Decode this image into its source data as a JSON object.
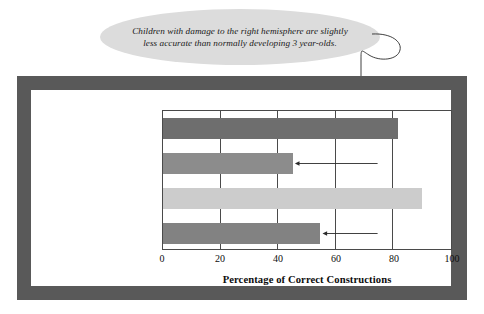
{
  "callout": {
    "text": "Children with damage to the right hemisphere are slightly less accurate than normally developing 3 year-olds."
  },
  "colors": {
    "frame": "#595959",
    "panel": "#ffffff",
    "callout_fill": "#dcdcdc",
    "axis": "#4a4a4a",
    "bar_left_hemisphere": "#6e6e6e",
    "bar_right_hemisphere": "#8c8c8c",
    "bar_4_year_olds": "#cccccc",
    "bar_3_year_olds": "#828282",
    "text": "#0d0d0d"
  },
  "chart_data": {
    "type": "bar",
    "orientation": "horizontal",
    "title": "",
    "xlabel": "Percentage of Correct Constructions",
    "ylabel": "",
    "xlim": [
      0,
      100
    ],
    "xticks": [
      0,
      20,
      40,
      60,
      80,
      100
    ],
    "xtick_labels": [
      "0",
      "20",
      "40",
      "60",
      "80",
      "100"
    ],
    "grid": true,
    "legend": false,
    "categories": [
      "Children with Left Hemisphere Damage",
      "Children with Right Hemisphere Damage",
      "4 Year-Olds",
      "3 Year-Olds"
    ],
    "category_lines": [
      [
        "Children with Left",
        "Hemisphere Damage"
      ],
      [
        "Children with Right",
        "Hemisphere Damage"
      ],
      [
        "4 Year-Olds"
      ],
      [
        "3 Year-Olds"
      ]
    ],
    "values": [
      82,
      45.5,
      90.5,
      55
    ],
    "bar_colors": [
      "#6e6e6e",
      "#8c8c8c",
      "#cccccc",
      "#828282"
    ],
    "annotations": [
      {
        "text": "Children with damage to the right hemisphere are slightly less accurate than normally developing 3 year-olds.",
        "points_to": [
          "Children with Right Hemisphere Damage",
          "3 Year-Olds"
        ],
        "leader_x_value": 74
      }
    ]
  }
}
